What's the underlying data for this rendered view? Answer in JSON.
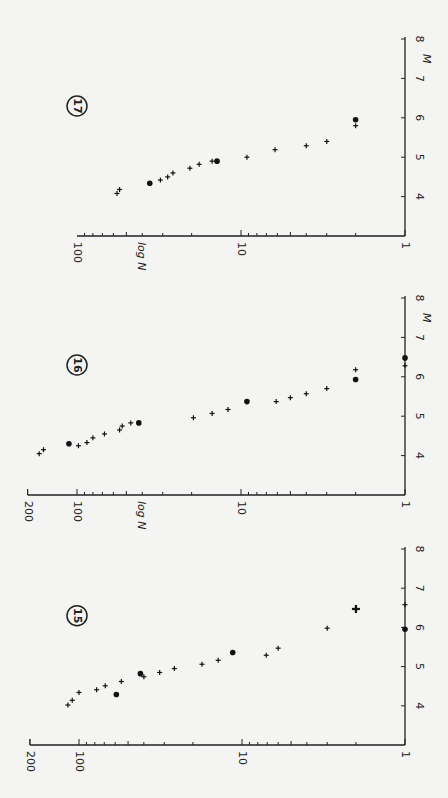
{
  "figure": {
    "orientation": "rotated 90° counter-clockwise",
    "colors": {
      "background": "#f4f4f2",
      "ink": "#222222"
    }
  },
  "chart_data": [
    {
      "type": "scatter",
      "panel_label": "17",
      "xlabel": "M",
      "ylabel": "log N",
      "xlim": [
        3,
        8
      ],
      "xticks": [
        "4",
        "5",
        "6",
        "7",
        "8"
      ],
      "ylim": [
        1,
        100
      ],
      "yscale": "log",
      "yticks": [
        "1",
        "10",
        "100"
      ],
      "geom": {
        "axis_y": 236,
        "m8_y": 39,
        "decade_px": 164
      },
      "series": [
        {
          "name": "cross",
          "marker": "plus",
          "points": [
            [
              4.08,
              57
            ],
            [
              4.18,
              55
            ],
            [
              4.42,
              31
            ],
            [
              4.5,
              28
            ],
            [
              4.6,
              26
            ],
            [
              4.72,
              20.5
            ],
            [
              4.82,
              18
            ],
            [
              4.9,
              15
            ],
            [
              5.0,
              9.2
            ],
            [
              5.19,
              6.2
            ],
            [
              5.29,
              4
            ],
            [
              5.4,
              3
            ],
            [
              5.8,
              2
            ]
          ]
        },
        {
          "name": "dot",
          "marker": "dot",
          "points": [
            [
              4.34,
              36
            ],
            [
              4.9,
              14
            ],
            [
              5.95,
              2
            ]
          ]
        }
      ]
    },
    {
      "type": "scatter",
      "panel_label": "16",
      "xlabel": "M",
      "ylabel": "log N",
      "xlim": [
        3,
        8
      ],
      "xticks": [
        "4",
        "5",
        "6",
        "7",
        "8"
      ],
      "ylim": [
        1,
        200
      ],
      "yscale": "log",
      "yticks": [
        "1",
        "10",
        "100",
        "200"
      ],
      "geom": {
        "axis_y": 495,
        "m8_y": 298,
        "decade_px": 164
      },
      "series": [
        {
          "name": "cross",
          "marker": "plus",
          "points": [
            [
              4.05,
              170
            ],
            [
              4.15,
              160
            ],
            [
              4.25,
              98
            ],
            [
              4.33,
              87
            ],
            [
              4.45,
              80
            ],
            [
              4.55,
              68
            ],
            [
              4.65,
              55
            ],
            [
              4.75,
              53
            ],
            [
              4.83,
              47
            ],
            [
              4.96,
              19.5
            ],
            [
              5.07,
              15
            ],
            [
              5.17,
              12
            ],
            [
              5.37,
              6.1
            ],
            [
              5.47,
              5
            ],
            [
              5.57,
              4
            ],
            [
              5.7,
              3
            ],
            [
              6.18,
              2
            ],
            [
              6.28,
              1
            ]
          ]
        },
        {
          "name": "dot",
          "marker": "dot",
          "points": [
            [
              4.3,
              112
            ],
            [
              4.83,
              42
            ],
            [
              5.37,
              9.2
            ],
            [
              5.93,
              2
            ],
            [
              6.48,
              1
            ]
          ]
        }
      ]
    },
    {
      "type": "scatter",
      "panel_label": "15",
      "xlabel": "",
      "ylabel": "",
      "xlim": [
        3,
        8
      ],
      "xticks": [
        "4",
        "5",
        "6",
        "7",
        "8"
      ],
      "ylim": [
        1,
        200
      ],
      "yscale": "log",
      "yticks": [
        "1",
        "10",
        "100",
        "200"
      ],
      "geom": {
        "axis_y": 745,
        "m8_y": 549,
        "decade_px": 163
      },
      "series": [
        {
          "name": "cross",
          "marker": "plus",
          "points": [
            [
              4.02,
              117
            ],
            [
              4.14,
              110
            ],
            [
              4.34,
              100
            ],
            [
              4.41,
              78
            ],
            [
              4.51,
              69
            ],
            [
              4.62,
              55
            ],
            [
              4.74,
              40
            ],
            [
              4.85,
              32
            ],
            [
              4.95,
              26
            ],
            [
              5.06,
              17.6
            ],
            [
              5.16,
              14
            ],
            [
              5.29,
              7.1
            ],
            [
              5.47,
              6
            ],
            [
              5.98,
              3
            ],
            [
              6.58,
              1
            ]
          ]
        },
        {
          "name": "dot",
          "marker": "dot",
          "points": [
            [
              4.29,
              59
            ],
            [
              4.82,
              42
            ],
            [
              5.36,
              11.4
            ],
            [
              5.95,
              1
            ]
          ]
        },
        {
          "name": "star",
          "marker": "star",
          "points": [
            [
              6.47,
              2
            ]
          ]
        }
      ]
    }
  ]
}
